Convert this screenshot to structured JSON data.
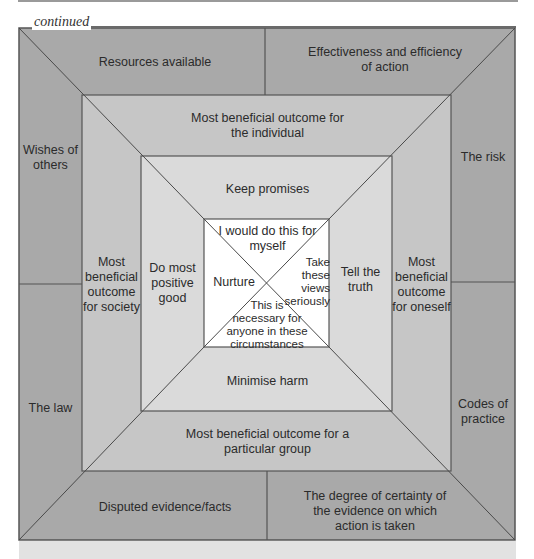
{
  "header": {
    "continued_label": "continued"
  },
  "colors": {
    "outer_ring": "#a9a9a9",
    "second_ring": "#c6c6c6",
    "third_ring": "#dadada",
    "center": "#ffffff",
    "lines": "#555555"
  },
  "outer_ring": {
    "top_left": "Resources available",
    "top_right": "Effectiveness and efficiency\nof action",
    "left_top": "Wishes of\nothers",
    "left_bottom": "The law",
    "right_top": "The risk",
    "right_bottom": "Codes of\npractice",
    "bottom_left": "Disputed evidence/facts",
    "bottom_right": "The degree of certainty of\nthe evidence on which\naction is taken"
  },
  "second_ring": {
    "top": "Most beneficial outcome for\nthe individual",
    "left": "Most\nbeneficial\noutcome\nfor society",
    "right": "Most\nbeneficial\noutcome\nfor oneself",
    "bottom": "Most beneficial outcome for a\nparticular group"
  },
  "third_ring": {
    "top": "Keep promises",
    "left": "Do most\npositive\ngood",
    "right": "Tell the\ntruth",
    "bottom": "Minimise harm"
  },
  "center": {
    "top": "I would do this for\nmyself",
    "left": "Nurture",
    "right": "Take\nthese\nviews\nseriously",
    "bottom": "This is\nnecessary for\nanyone in these\ncircumstances"
  }
}
